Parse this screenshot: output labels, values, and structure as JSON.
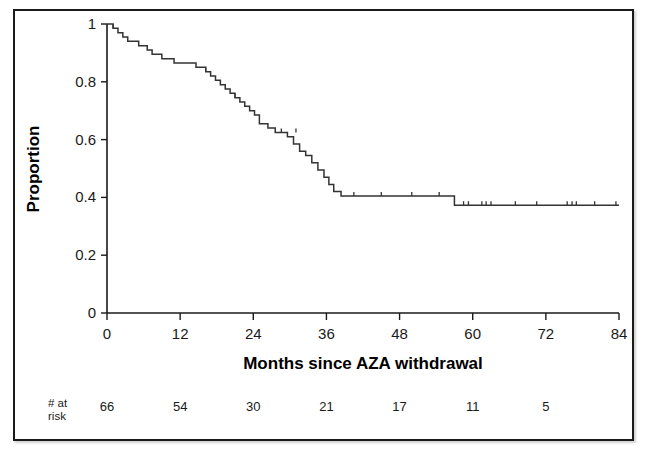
{
  "figure": {
    "caption_present": false,
    "border_color": "#1a1a1a",
    "background_color": "#ffffff",
    "curve_color": "#333333"
  },
  "chart_data": {
    "type": "line",
    "subtype": "kaplan-meier-survival-step",
    "title": "",
    "xlabel": "Months since AZA withdrawal",
    "ylabel": "Proportion",
    "xlim": [
      0,
      84
    ],
    "ylim": [
      0,
      1
    ],
    "xticks": [
      0,
      12,
      24,
      36,
      48,
      60,
      72,
      84
    ],
    "xtick_labels": [
      "0",
      "12",
      "24",
      "36",
      "48",
      "60",
      "72",
      "84"
    ],
    "yticks": [
      0,
      0.2,
      0.4,
      0.6,
      0.8,
      1
    ],
    "ytick_labels": [
      "0",
      "0.2",
      "0.4",
      "0.6",
      "0.8",
      "1"
    ],
    "grid": false,
    "legend": null,
    "series": [
      {
        "name": "Relapse-free survival after AZA withdrawal",
        "step": "post",
        "x": [
          0,
          1.0,
          1.8,
          2.6,
          3.4,
          5.2,
          6.6,
          7.4,
          8.2,
          9.0,
          10.2,
          11.0,
          12.0,
          13.0,
          14.6,
          16.2,
          17.0,
          17.8,
          18.6,
          19.4,
          20.2,
          21.0,
          21.8,
          22.6,
          23.4,
          24.2,
          25.0,
          26.4,
          27.6,
          28.6,
          29.6,
          30.6,
          31.6,
          32.6,
          33.6,
          34.6,
          35.6,
          36.4,
          37.2,
          38.4,
          57.0,
          84.0
        ],
        "y": [
          1.0,
          0.985,
          0.97,
          0.955,
          0.94,
          0.925,
          0.91,
          0.895,
          0.895,
          0.88,
          0.88,
          0.865,
          0.865,
          0.865,
          0.85,
          0.835,
          0.82,
          0.805,
          0.79,
          0.775,
          0.76,
          0.745,
          0.73,
          0.715,
          0.7,
          0.685,
          0.655,
          0.64,
          0.625,
          0.625,
          0.61,
          0.585,
          0.56,
          0.545,
          0.52,
          0.495,
          0.47,
          0.445,
          0.42,
          0.405,
          0.373,
          0.373
        ]
      }
    ],
    "censor_marks": {
      "symbol": "tick",
      "x": [
        1.0,
        16.2,
        21.0,
        28.6,
        31.0,
        40.5,
        45.0,
        50.0,
        54.5,
        58.5,
        59.3,
        61.5,
        62.2,
        63.0,
        67.0,
        70.5,
        75.5,
        76.3,
        77.0,
        80.0,
        83.5
      ],
      "y": [
        0.985,
        0.835,
        0.745,
        0.625,
        0.625,
        0.405,
        0.405,
        0.405,
        0.405,
        0.373,
        0.373,
        0.373,
        0.373,
        0.373,
        0.373,
        0.373,
        0.373,
        0.373,
        0.373,
        0.373,
        0.373
      ]
    },
    "risk_table": {
      "label_line1": "# at",
      "label_line2": "risk",
      "times": [
        0,
        12,
        24,
        36,
        48,
        60,
        72
      ],
      "counts": [
        "66",
        "54",
        "30",
        "21",
        "17",
        "11",
        "5"
      ]
    }
  }
}
